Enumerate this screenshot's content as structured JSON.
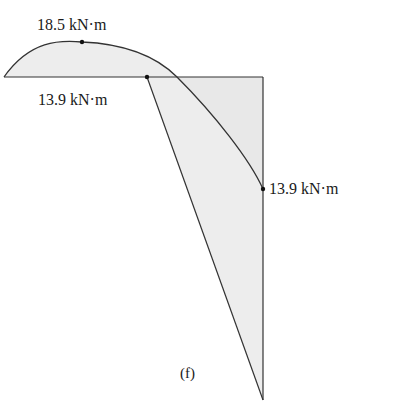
{
  "figure": {
    "caption": "(f)",
    "labels": {
      "peak_moment": "18.5 kN·m",
      "base_moment": "13.9 kN·m",
      "right_moment": "13.9 kN·m"
    },
    "colors": {
      "fill": "#ededed",
      "stroke": "#333333",
      "dot": "#111111"
    }
  },
  "diagram": {
    "points": {
      "left_end": [
        4,
        77
      ],
      "peak": [
        82,
        42
      ],
      "base_point": [
        147,
        77
      ],
      "top_right_corner": [
        263,
        77
      ],
      "right_point": [
        263,
        189
      ],
      "bottom_tip": [
        263,
        400
      ]
    }
  }
}
